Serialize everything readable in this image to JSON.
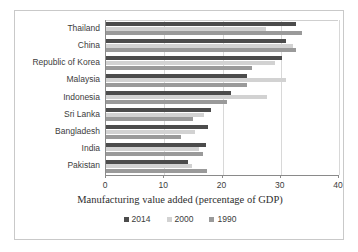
{
  "chart_data": {
    "type": "bar",
    "orientation": "horizontal",
    "title": "",
    "xlabel": "Manufacturing value added (percentage of GDP)",
    "ylabel": "",
    "xlim": [
      0,
      40
    ],
    "xticks": [
      0,
      10,
      20,
      30,
      40
    ],
    "grid": true,
    "legend_position": "bottom",
    "categories": [
      "Thailand",
      "China",
      "Republic of Korea",
      "Malaysia",
      "Indonesia",
      "Sri Lanka",
      "Bangladesh",
      "India",
      "Pakistan"
    ],
    "series": [
      {
        "name": "2014",
        "color": "#4c4c4c",
        "values": [
          32.6,
          30.9,
          30.3,
          24.2,
          21.5,
          18.0,
          17.5,
          17.2,
          14.0
        ]
      },
      {
        "name": "2000",
        "color": "#d2d2d2",
        "values": [
          27.4,
          32.1,
          29.0,
          30.9,
          27.7,
          16.8,
          15.2,
          16.0,
          14.8
        ]
      },
      {
        "name": "1990",
        "color": "#9a9a9a",
        "values": [
          33.7,
          32.7,
          25.1,
          24.2,
          20.7,
          14.9,
          12.9,
          16.7,
          17.4
        ]
      }
    ]
  }
}
